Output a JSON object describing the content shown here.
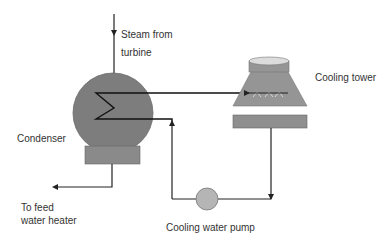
{
  "labels": {
    "steam_line1": "Steam from",
    "steam_line2": "turbine",
    "cooling_tower": "Cooling tower",
    "condenser": "Condenser",
    "feed_line1": "To feed",
    "feed_line2": "water heater",
    "pump": "Cooling water pump"
  },
  "colors": {
    "condenser_fill": "#7d7d7d",
    "base_fill": "#8a8a8a",
    "tower_fill": "#959595",
    "tower_top_fill": "#dcdcdc",
    "pump_fill": "#b5b5b5",
    "line": "#222222",
    "vapor": "#d6d6d6"
  }
}
